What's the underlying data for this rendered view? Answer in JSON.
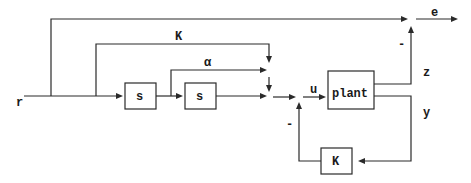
{
  "diagram": {
    "type": "block-diagram",
    "signals": {
      "r": "r",
      "e": "e",
      "z": "z",
      "y": "y",
      "u": "u",
      "K_gain_label": "K",
      "alpha_label": "α"
    },
    "blocks": {
      "s1": "s",
      "s2": "s",
      "plant": "plant",
      "feedback_K": "K"
    },
    "signs": {
      "z_to_e_sign": "-",
      "feedback_sign": "-"
    }
  }
}
